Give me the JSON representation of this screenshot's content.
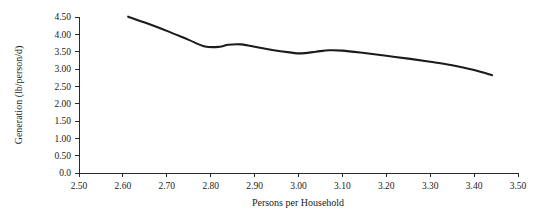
{
  "chart_data": {
    "type": "line",
    "title": "",
    "xlabel": "Persons per Household",
    "ylabel": "Generation (lb/person/d)",
    "xlim": [
      2.5,
      3.5
    ],
    "ylim": [
      0.0,
      4.5
    ],
    "grid": false,
    "legend": null,
    "x_tick_labels": [
      "2.50",
      "2.60",
      "2.70",
      "2.80",
      "2.90",
      "3.00",
      "3.10",
      "3.20",
      "3.30",
      "3.40",
      "3.50"
    ],
    "x_tick_values": [
      2.5,
      2.6,
      2.7,
      2.8,
      2.9,
      3.0,
      3.1,
      3.2,
      3.3,
      3.4,
      3.5
    ],
    "y_tick_labels": [
      "0.0",
      "0.50",
      "1.00",
      "1.50",
      "2.00",
      "2.50",
      "3.00",
      "3.50",
      "4.00",
      "4.50"
    ],
    "y_tick_values": [
      0.0,
      0.5,
      1.0,
      1.5,
      2.0,
      2.5,
      3.0,
      3.5,
      4.0,
      4.5
    ],
    "line_color": "#1b1b1b",
    "line_width": 2.1,
    "series": [
      {
        "name": "Generation",
        "x": [
          2.612,
          2.65,
          2.7,
          2.75,
          2.787,
          2.82,
          2.84,
          2.87,
          2.9,
          2.94,
          2.98,
          3.005,
          3.04,
          3.07,
          3.1,
          3.15,
          3.2,
          3.25,
          3.3,
          3.35,
          3.4,
          3.441
        ],
        "y": [
          4.51,
          4.34,
          4.1,
          3.84,
          3.65,
          3.64,
          3.7,
          3.71,
          3.64,
          3.55,
          3.48,
          3.45,
          3.5,
          3.54,
          3.53,
          3.46,
          3.38,
          3.3,
          3.21,
          3.11,
          2.97,
          2.82
        ]
      }
    ]
  }
}
